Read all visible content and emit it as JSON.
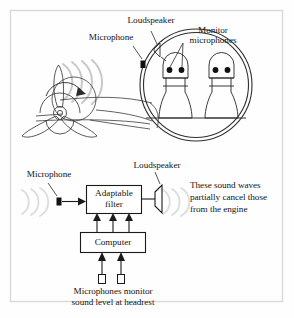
{
  "figure": {
    "border_color": "#d8d8d8",
    "ink_color": "#1a1a1a",
    "wave_color": "#c9c9c9",
    "cabin": {
      "label_loudspeaker": "Loudspeaker",
      "label_microphone": "Microphone",
      "label_monitor_line1": "Monitor",
      "label_monitor_line2": "microphones",
      "seat_count": 2,
      "monitor_mics_per_head": 2,
      "propeller_blades": 3,
      "engine_wave_arcs": 4
    },
    "block_diagram": {
      "label_microphone": "Microphone",
      "label_loudspeaker": "Loudspeaker",
      "box_filter_line1": "Adaptable",
      "box_filter_line2": "filter",
      "box_computer": "Computer",
      "note_line1": "These sound waves",
      "note_line2": "partially cancel those",
      "note_line3": "from the engine",
      "caption_line1": "Microphones monitor",
      "caption_line2": "sound level at headrest",
      "filter_to_computer_arrows": 3,
      "mic_to_computer_arrows": 2,
      "headrest_mic_count": 2
    }
  },
  "icons": {
    "microphone": "microphone-icon",
    "loudspeaker": "loudspeaker-icon",
    "propeller": "propeller-icon",
    "rotation_arrow": "rotation-arrow-icon",
    "sound_wave": "sound-wave-icon",
    "head": "passenger-head-icon",
    "seat": "seat-icon"
  }
}
